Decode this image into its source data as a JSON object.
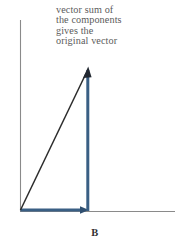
{
  "figure": {
    "panel_label": "B",
    "annotation": {
      "lines": [
        "vector sum of",
        "the components",
        "gives the",
        "original vector"
      ],
      "color": "#5b5b5b"
    },
    "colors": {
      "axis": "#8a8a8a",
      "component_vector": "#3a5f84",
      "resultant_vector": "#2b2b2b",
      "background": "#ffffff"
    },
    "axes": {
      "origin": {
        "x": 20,
        "y": 211
      },
      "x_axis": {
        "from_x": 20,
        "to_x": 175,
        "y": 211
      },
      "y_axis": {
        "x": 20,
        "from_y": 20,
        "to_y": 211
      }
    },
    "vectors": [
      {
        "name": "x-component",
        "start": {
          "x": 20,
          "y": 210
        },
        "end": {
          "x": 88,
          "y": 210
        },
        "color": "#3a5f84",
        "width": 3,
        "arrowhead": true
      },
      {
        "name": "y-component",
        "start": {
          "x": 88,
          "y": 210
        },
        "end": {
          "x": 88,
          "y": 70
        },
        "color": "#3a5f84",
        "width": 3,
        "arrowhead": false
      },
      {
        "name": "resultant-vector",
        "start": {
          "x": 20,
          "y": 210
        },
        "end": {
          "x": 88,
          "y": 68
        },
        "color": "#2b2b2b",
        "width": 1.4,
        "arrowhead": true
      }
    ]
  }
}
